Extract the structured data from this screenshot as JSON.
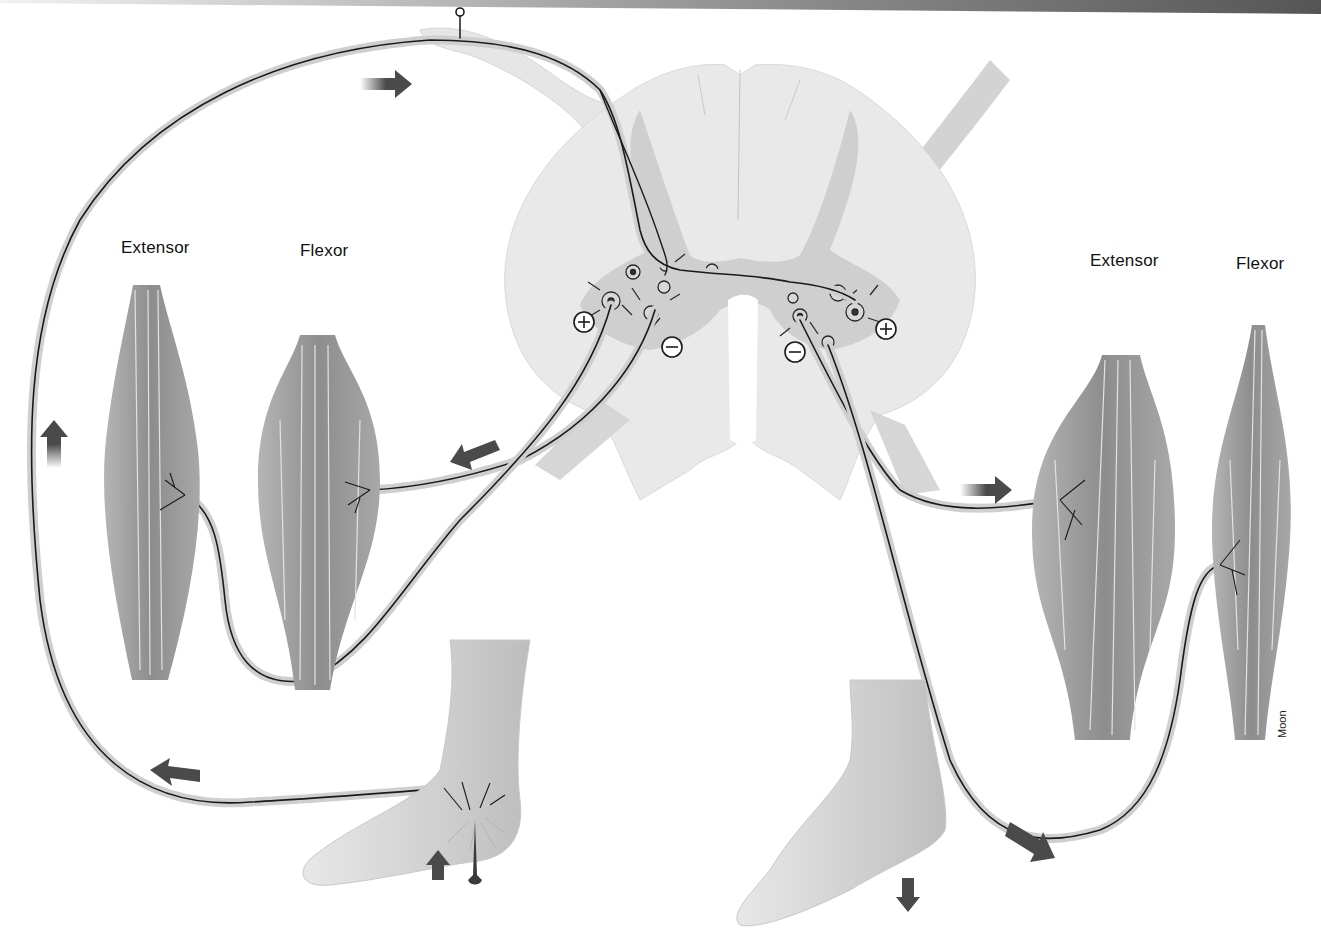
{
  "figure": {
    "labels": {
      "left_extensor": "Extensor",
      "left_flexor": "Flexor",
      "right_extensor": "Extensor",
      "right_flexor": "Flexor"
    },
    "synapse_signs": {
      "left_excitatory": "+",
      "left_inhibitory": "−",
      "right_inhibitory": "−",
      "right_excitatory": "+"
    },
    "signature": "Moon",
    "arrows": [
      {
        "id": "afferent-top",
        "direction": "right"
      },
      {
        "id": "afferent-left",
        "direction": "up"
      },
      {
        "id": "afferent-bottom",
        "direction": "up-left"
      },
      {
        "id": "stimulus-foot",
        "direction": "up"
      },
      {
        "id": "left-flexor-efferent",
        "direction": "down-left"
      },
      {
        "id": "right-extensor-efferent",
        "direction": "right"
      },
      {
        "id": "right-flexor-efferent",
        "direction": "down-right"
      },
      {
        "id": "right-foot",
        "direction": "down"
      }
    ],
    "colors": {
      "background": "#ffffff",
      "cord_white_matter": "#e9e9e9",
      "cord_gray_matter": "#cfcfcf",
      "muscle": "#9a9a9a",
      "nerve": "#1a1a1a",
      "arrow": "#4a4a4a",
      "skin": "#dcdcdc"
    }
  }
}
